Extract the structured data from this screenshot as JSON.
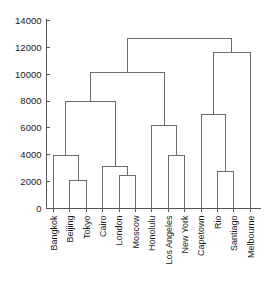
{
  "chart_data": {
    "type": "dendrogram",
    "title": "",
    "xlabel": "",
    "ylabel": "",
    "ylim": [
      0,
      14000
    ],
    "yticks": [
      0,
      2000,
      4000,
      6000,
      8000,
      10000,
      12000,
      14000
    ],
    "ytick_labels": [
      "0",
      "2000",
      "4000",
      "6000",
      "8000",
      "10000",
      "12000",
      "14000"
    ],
    "grid": false,
    "legend": false,
    "leaves": [
      "Bangkok",
      "Beijing",
      "Tokyo",
      "Cairo",
      "London",
      "Moscow",
      "Honolulu",
      "Los Angeles",
      "New York",
      "Capetown",
      "Rio",
      "Santiago",
      "Melbourne"
    ],
    "merges": [
      {
        "id": "m1",
        "label": "Beijing + Tokyo",
        "left": "Beijing",
        "right": "Tokyo",
        "height": 2100
      },
      {
        "id": "m2",
        "label": "London + Moscow",
        "left": "London",
        "right": "Moscow",
        "height": 2450
      },
      {
        "id": "m3",
        "label": "Rio + Santiago",
        "left": "Rio",
        "right": "Santiago",
        "height": 2750
      },
      {
        "id": "m4",
        "label": "Cairo + (London, Moscow)",
        "left": "Cairo",
        "right": "m2",
        "height": 3100
      },
      {
        "id": "m5",
        "label": "Bangkok + (Beijing, Tokyo)",
        "left": "Bangkok",
        "right": "m1",
        "height": 3980
      },
      {
        "id": "m6",
        "label": "Los Angeles + New York",
        "left": "Los Angeles",
        "right": "New York",
        "height": 3950
      },
      {
        "id": "m7",
        "label": "Honolulu + (Los Angeles, New York)",
        "left": "Honolulu",
        "right": "m6",
        "height": 6200
      },
      {
        "id": "m8",
        "label": "Capetown + (Rio, Santiago)",
        "left": "Capetown",
        "right": "m3",
        "height": 7030
      },
      {
        "id": "m9",
        "label": "(Bangkok cluster) + (Cairo cluster)",
        "left": "m5",
        "right": "m4",
        "height": 8000
      },
      {
        "id": "m10",
        "label": "(Asia-Europe) + (Honolulu cluster)",
        "left": "m9",
        "right": "m7",
        "height": 10150
      },
      {
        "id": "m11",
        "label": "(Capetown cluster) + Melbourne",
        "left": "m8",
        "right": "Melbourne",
        "height": 11650
      },
      {
        "id": "m12",
        "label": "Root",
        "left": "m10",
        "right": "m11",
        "height": 12640
      }
    ]
  }
}
